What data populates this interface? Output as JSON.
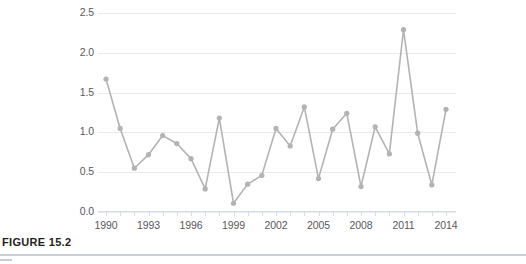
{
  "figure": {
    "caption_label": "FIGURE 15.2"
  },
  "chart_data": {
    "type": "line",
    "title": "",
    "xlabel": "",
    "ylabel": "",
    "xlim": [
      1990,
      2014
    ],
    "ylim": [
      0.0,
      2.5
    ],
    "grid": true,
    "legend": null,
    "marker": "circle",
    "series_color": "#b3b3b3",
    "gridline_color": "#e9ecef",
    "tick_label_color": "#58585a",
    "ytick_labels": [
      "0.0",
      "0.5",
      "1.0",
      "1.5",
      "2.0",
      "2.5"
    ],
    "ytick_values": [
      0.0,
      0.5,
      1.0,
      1.5,
      2.0,
      2.5
    ],
    "xtick_labels": [
      "1990",
      "1993",
      "1996",
      "1999",
      "2002",
      "2005",
      "2008",
      "2011",
      "2014"
    ],
    "xtick_values": [
      1990,
      1993,
      1996,
      1999,
      2002,
      2005,
      2008,
      2011,
      2014
    ],
    "x": [
      1990,
      1991,
      1992,
      1993,
      1994,
      1995,
      1996,
      1997,
      1998,
      1999,
      2000,
      2001,
      2002,
      2003,
      2004,
      2005,
      2006,
      2007,
      2008,
      2009,
      2010,
      2011,
      2012,
      2013,
      2014
    ],
    "values": [
      1.67,
      1.05,
      0.55,
      0.72,
      0.96,
      0.86,
      0.67,
      0.29,
      1.18,
      0.11,
      0.35,
      0.46,
      1.05,
      0.83,
      1.32,
      0.42,
      1.04,
      1.24,
      0.32,
      1.07,
      0.73,
      2.29,
      0.99,
      0.34,
      1.29
    ]
  }
}
